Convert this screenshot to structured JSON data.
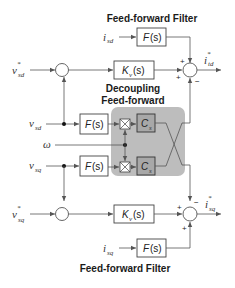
{
  "titles": {
    "top_filter": "Feed-forward Filter",
    "decoupling_line1": "Decoupling",
    "decoupling_line2": "Feed-forward",
    "bottom_filter": "Feed-forward Filter"
  },
  "signals": {
    "isd": {
      "main": "i",
      "sub": "sd"
    },
    "isq": {
      "main": "i",
      "sub": "sq"
    },
    "vsd_ref": {
      "main": "v",
      "sup": "*",
      "sub": "sd"
    },
    "vsq_ref": {
      "main": "v",
      "sup": "*",
      "sub": "sq"
    },
    "vsd": {
      "main": "v",
      "sub": "sd"
    },
    "vsq": {
      "main": "v",
      "sub": "sq"
    },
    "omega": {
      "main": "ω"
    },
    "itd_ref": {
      "main": "i",
      "sup": "*",
      "sub": "td"
    },
    "isq_ref": {
      "main": "i",
      "sup": "*",
      "sub": "sq"
    }
  },
  "blocks": {
    "filter_top": {
      "name": "F",
      "arg": "(s)"
    },
    "kv_top": {
      "name": "K",
      "sub": "v",
      "arg": "(s)"
    },
    "filter_vsd": {
      "name": "F",
      "arg": "(s)"
    },
    "filter_vsq": {
      "name": "F",
      "arg": "(s)"
    },
    "cs_top": {
      "name": "C",
      "sub": "s"
    },
    "cs_bottom": {
      "name": "C",
      "sub": "s"
    },
    "kv_bottom": {
      "name": "K",
      "sub": "v",
      "arg": "(s)"
    },
    "filter_bottom": {
      "name": "F",
      "arg": "(s)"
    }
  },
  "signs": {
    "sum_top_upper": "+",
    "sum_top_left": "+",
    "sum_top_lower": "−",
    "sum_bot_upper": "−",
    "sum_bot_left": "+",
    "sum_bot_lower": "+"
  },
  "colors": {
    "decoupling_region": "#bdbdbd",
    "cs_block": "#a8a8a8",
    "wire": "#555555"
  }
}
